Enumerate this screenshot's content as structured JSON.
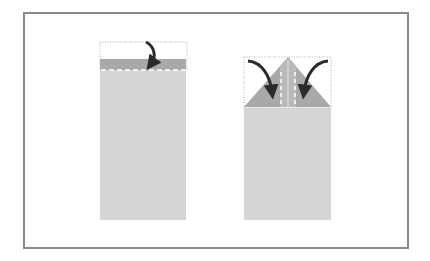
{
  "diagram": {
    "title": "",
    "steps": [
      {
        "name": "step-fold-top-edge-down",
        "paper": {
          "x": 100,
          "y": 59,
          "w": 86,
          "h": 161
        },
        "ghost_outline": {
          "x": 100,
          "y": 42,
          "w": 87,
          "h": 28
        },
        "folded_band": {
          "y_top": 59,
          "y_bottom": 70
        },
        "fold_line_y": 70,
        "arrow": "curved-down"
      },
      {
        "name": "step-fold-corners-to-center",
        "paper": {
          "x": 244,
          "y": 57,
          "w": 87,
          "h": 163
        },
        "ghost_outline": {
          "x": 244,
          "y": 57,
          "w": 87,
          "h": 51
        },
        "peak": {
          "x": 288,
          "y": 57
        },
        "base_y": 107,
        "fold_lines_x": [
          281,
          295
        ],
        "arrows": [
          "left-curved-down",
          "right-curved-down"
        ]
      }
    ],
    "colors": {
      "frame": "#8a8a8a",
      "paper": "#d5d5d5",
      "folded": "#a9a9a9",
      "center_strip": "#b9b9b9",
      "arrow": "#2b2b2b",
      "fold_line": "#ffffff",
      "ghost": "#b0b0b0"
    }
  }
}
